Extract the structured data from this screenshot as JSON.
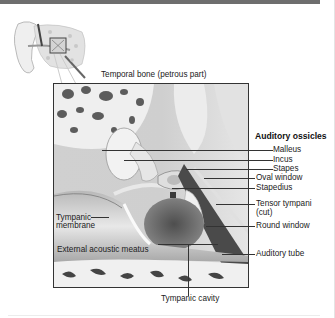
{
  "figure": {
    "top_label": "Temporal bone (petrous part)",
    "bottom_label": "Tympanic cavity",
    "group_heading": "Auditory ossicles",
    "right_labels": [
      {
        "id": "malleus",
        "text": "Malleus"
      },
      {
        "id": "incus",
        "text": "Incus"
      },
      {
        "id": "stapes",
        "text": "Stapes"
      },
      {
        "id": "oval-window",
        "text": "Oval window"
      },
      {
        "id": "stapedius",
        "text": "Stapedius"
      },
      {
        "id": "tensor-tympani",
        "text": "Tensor tympani"
      },
      {
        "id": "tensor-tympani-note",
        "text": "(cut)"
      },
      {
        "id": "round-window",
        "text": "Round window"
      },
      {
        "id": "auditory-tube",
        "text": "Auditory tube"
      }
    ],
    "left_labels": [
      {
        "id": "tympanic-membrane-1",
        "text": "Tympanic"
      },
      {
        "id": "tympanic-membrane-2",
        "text": "membrane"
      },
      {
        "id": "external-acoustic-meatus",
        "text": "External acoustic meatus"
      }
    ]
  },
  "colors": {
    "header_bar": "#6e6e6e",
    "bone": "#e8e8e8",
    "tissue_dark": "#5a5a5a",
    "leader_line": "#333333"
  }
}
